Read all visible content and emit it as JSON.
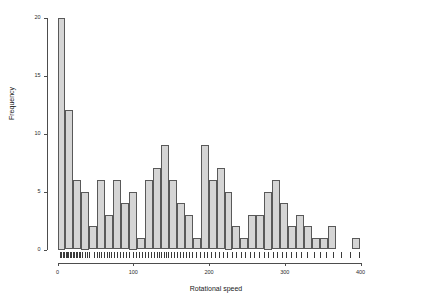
{
  "chart_data": {
    "type": "bar",
    "title": "",
    "subtitle": "",
    "xlabel": "Rotational speed",
    "ylabel": "Frequency",
    "xlim": [
      -5,
      425
    ],
    "ylim": [
      0,
      20
    ],
    "xticks": [
      0,
      100,
      200,
      300,
      400
    ],
    "yticks": [
      0,
      5,
      10,
      15,
      20
    ],
    "grid": false,
    "legend": null,
    "binwidth": 10.5,
    "bin_starts": [
      0,
      10.5,
      21,
      31.5,
      42,
      52.5,
      63,
      73.5,
      84,
      94.5,
      105,
      115.5,
      126,
      136.5,
      147,
      157.5,
      168,
      178.5,
      189,
      199.5,
      210,
      220.5,
      231,
      241.5,
      252,
      262.5,
      273,
      283.5,
      294,
      304.5,
      315,
      325.5,
      336,
      346.5,
      357,
      367.5,
      378,
      388.5,
      399,
      409.5
    ],
    "categories": [
      "0",
      "10.5",
      "21",
      "31.5",
      "42",
      "52.5",
      "63",
      "73.5",
      "84",
      "94.5",
      "105",
      "115.5",
      "126",
      "136.5",
      "147",
      "157.5",
      "168",
      "178.5",
      "189",
      "199.5",
      "210",
      "220.5",
      "231",
      "241.5",
      "252",
      "262.5",
      "273",
      "283.5",
      "294",
      "304.5",
      "315",
      "325.5",
      "336",
      "346.5",
      "357",
      "367.5",
      "378",
      "388.5",
      "399",
      "409.5"
    ],
    "values": [
      20,
      12,
      6,
      5,
      2,
      6,
      3,
      6,
      4,
      5,
      1,
      6,
      7,
      9,
      6,
      4,
      3,
      1,
      9,
      6,
      7,
      5,
      2,
      1,
      3,
      3,
      5,
      6,
      4,
      2,
      3,
      2,
      1,
      1,
      2,
      0,
      0,
      1,
      0,
      0
    ],
    "bar_fill": "#d5d5d5",
    "bar_border": "#595959",
    "axis_color": "#4d4d4d",
    "rug": true,
    "rug_values": [
      3,
      5,
      7,
      9,
      11,
      13,
      14,
      16,
      18,
      20,
      22,
      24,
      26,
      28,
      30,
      33,
      36,
      39,
      42,
      48,
      52,
      55,
      58,
      62,
      65,
      68,
      71,
      74,
      78,
      82,
      86,
      90,
      95,
      100,
      104,
      108,
      112,
      116,
      120,
      124,
      128,
      131,
      134,
      137,
      140,
      143,
      146,
      150,
      154,
      158,
      162,
      166,
      170,
      174,
      178,
      183,
      188,
      193,
      198,
      203,
      208,
      213,
      218,
      224,
      230,
      236,
      242,
      248,
      254,
      260,
      266,
      272,
      278,
      284,
      290,
      296,
      302,
      308,
      315,
      322,
      330,
      338,
      346,
      355,
      364,
      374,
      386,
      398
    ]
  },
  "figure": {
    "background": "#ffffff",
    "axis_title_x": "Rotational speed",
    "axis_title_y": "Frequency"
  }
}
